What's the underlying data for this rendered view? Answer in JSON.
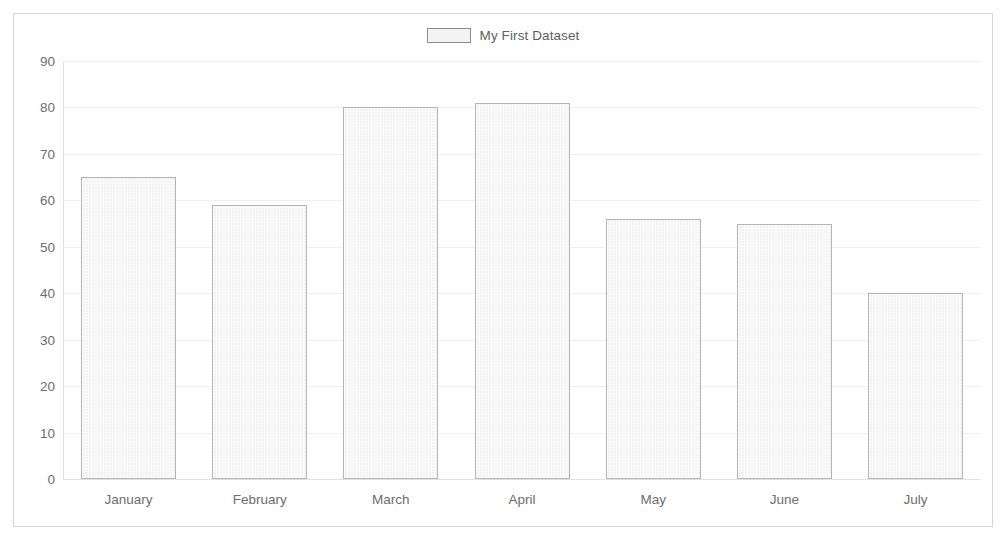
{
  "chart_data": {
    "type": "bar",
    "title": "",
    "subtitle": "",
    "xlabel": "",
    "ylabel": "",
    "categories": [
      "January",
      "February",
      "March",
      "April",
      "May",
      "June",
      "July"
    ],
    "series": [
      {
        "name": "My First Dataset",
        "values": [
          65,
          59,
          80,
          81,
          56,
          55,
          40
        ]
      }
    ],
    "ylim": [
      0,
      90
    ],
    "ytick_step": 10,
    "yticks": [
      0,
      10,
      20,
      30,
      40,
      50,
      60,
      70,
      80,
      90
    ],
    "ytick_labels": [
      "0",
      "10",
      "20",
      "30",
      "40",
      "50",
      "60",
      "70",
      "80",
      "90"
    ],
    "grid": true,
    "grid_axis": "y",
    "legend": true,
    "legend_position": "top",
    "legend_entries": [
      {
        "label": "My First Dataset",
        "swatch": "#f3f3f3",
        "border": "#8c8c8c"
      }
    ],
    "colors": {
      "bar_fill": "#f2f2f2",
      "bar_border": "#b4b4b4",
      "gridline": "#f0f0f0",
      "axis": "#e0e0e0",
      "frame_border": "#d5d5d5",
      "tick_text": "#6d6d6d",
      "legend_text": "#5e5e5e",
      "background": "#ffffff"
    }
  }
}
